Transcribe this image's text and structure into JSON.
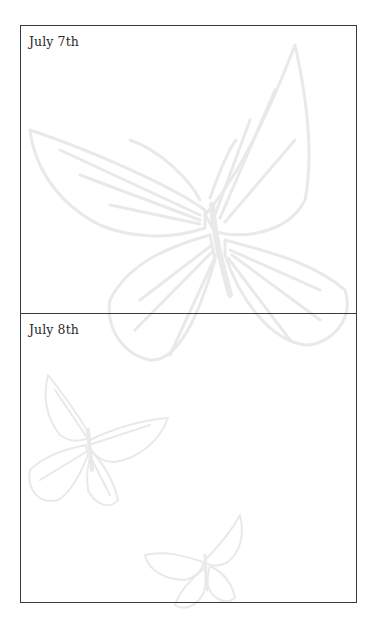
{
  "journal": {
    "entries": [
      {
        "date": "July 7th",
        "body": ""
      },
      {
        "date": "July 8th",
        "body": ""
      }
    ]
  },
  "decorations": {
    "watermark_icons": [
      "large-butterfly-icon",
      "small-butterfly-icon",
      "tiny-butterfly-icon"
    ],
    "watermark_color": "#ebebeb",
    "border_color": "#3a3a3a"
  }
}
